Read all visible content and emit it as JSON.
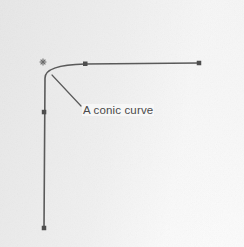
{
  "figure": {
    "background_color": "#f3f3f3",
    "ink_color": "#5a5a5a",
    "label_color": "#4a4a4a",
    "annotation": {
      "text": "A conic curve",
      "leader_from": [
        52,
        75
      ],
      "leader_to": [
        81,
        106
      ],
      "text_position": [
        82,
        104
      ]
    },
    "start_marker": {
      "glyph": "✳",
      "position": [
        43,
        62
      ]
    },
    "control_points": [
      {
        "name": "right-endpoint",
        "x": 199,
        "y": 63
      },
      {
        "name": "top-control-point",
        "x": 85,
        "y": 64
      },
      {
        "name": "corner-point",
        "x": 45,
        "y": 74
      },
      {
        "name": "left-control-point",
        "x": 44,
        "y": 112
      },
      {
        "name": "bottom-endpoint",
        "x": 44,
        "y": 228
      }
    ],
    "curve": {
      "type": "conic",
      "path": "M 199 63 L 85 64 Q 45 65 45 78 L 44 228",
      "stroke_width": 1.6
    }
  },
  "chart_data": {
    "type": "line",
    "title": "A conic curve",
    "xlabel": "",
    "ylabel": "",
    "series": [
      {
        "name": "A conic curve",
        "points": [
          [
            199,
            63
          ],
          [
            85,
            64
          ],
          [
            45,
            74
          ],
          [
            44,
            112
          ],
          [
            44,
            228
          ]
        ]
      }
    ],
    "annotations": [
      "A conic curve"
    ],
    "grid": false,
    "legend": "none"
  }
}
